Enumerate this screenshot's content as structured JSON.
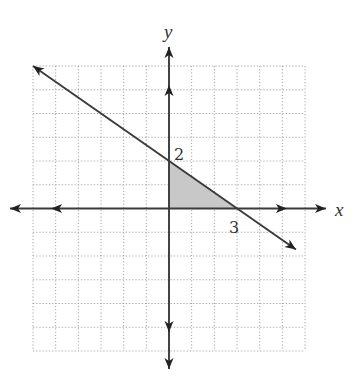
{
  "chart_data": {
    "type": "line",
    "title": "",
    "xlabel": "x",
    "ylabel": "y",
    "xlim": [
      -6,
      6
    ],
    "ylim": [
      -6,
      6
    ],
    "grid": true,
    "grid_style": "dotted",
    "lines": [
      {
        "name": "boundary",
        "equation": "y = -2/3 x + 2",
        "slope": -0.6667,
        "intercept": 2,
        "from": [
          -6,
          6
        ],
        "to": [
          5.6,
          -1.73
        ],
        "arrows": "both"
      }
    ],
    "shaded_region": {
      "name": "feasible-triangle",
      "vertices": [
        [
          0,
          0
        ],
        [
          0,
          2
        ],
        [
          3,
          0
        ]
      ],
      "color": "#c8c8c8"
    },
    "annotations": [
      {
        "text": "2",
        "at": [
          0,
          2
        ],
        "meaning": "y-intercept"
      },
      {
        "text": "3",
        "at": [
          3,
          0
        ],
        "meaning": "x-intercept"
      }
    ]
  },
  "labels": {
    "x_axis": "x",
    "y_axis": "y",
    "y_intercept": "2",
    "x_intercept": "3"
  }
}
